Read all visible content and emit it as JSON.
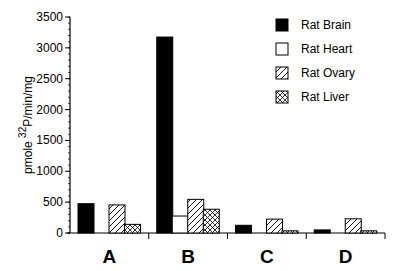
{
  "chart_data": {
    "type": "bar",
    "title": "",
    "xlabel": "",
    "ylabel": "pmole 32P/min/mg",
    "ylabel_parts": {
      "pre": "pmole ",
      "sup": "32",
      "post": "P/min/mg"
    },
    "ylim": [
      0,
      3500
    ],
    "yticks": [
      0,
      500,
      1000,
      1500,
      2000,
      2500,
      3000,
      3500
    ],
    "grid": false,
    "legend_position": "upper right",
    "categories": [
      "A",
      "B",
      "C",
      "D"
    ],
    "series": [
      {
        "name": "Rat Brain",
        "pattern": "solid",
        "values": [
          475,
          3175,
          125,
          50
        ]
      },
      {
        "name": "Rat Heart",
        "pattern": "empty",
        "values": [
          0,
          275,
          0,
          0
        ]
      },
      {
        "name": "Rat Ovary",
        "pattern": "diagonal",
        "values": [
          455,
          545,
          225,
          230
        ]
      },
      {
        "name": "Rat Liver",
        "pattern": "crosshatch",
        "values": [
          140,
          385,
          35,
          35
        ]
      }
    ]
  }
}
